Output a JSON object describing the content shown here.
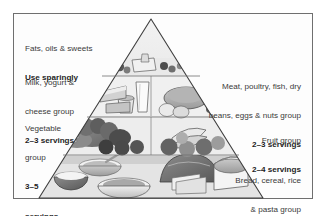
{
  "figure": {
    "kind": "food-guide-pyramid",
    "frame_border_color": "#6f6f6f",
    "background_color": "#ffffff",
    "text_color": "#3a3a3a",
    "emphasis_text_color": "#1d1d1d"
  },
  "labels": {
    "fats": {
      "line1": "Fats, oils & sweets",
      "line2": "Use sparingly"
    },
    "milk": {
      "line1": "Milk, yogurt &",
      "line2": "cheese group",
      "line3": "2–3 servings"
    },
    "vegetable": {
      "line1": "Vegetable",
      "line2": "group",
      "line3": "3–5",
      "line4": "servings"
    },
    "meat": {
      "line1": "Meat, poultry, fish, dry",
      "line2": "beans, eggs & nuts group",
      "line3": "2–3 servings"
    },
    "fruit": {
      "line1": "Fruit group",
      "line2": "2–4 servings"
    },
    "bread": {
      "line1": "Bread, cereal, rice",
      "line2": "& pasta group",
      "line3": "6–11 servings"
    }
  },
  "pyramid": {
    "tiers": [
      {
        "name": "fats-oils-sweets-tier",
        "foods": [
          "butter",
          "candies",
          "oil",
          "sweets"
        ]
      },
      {
        "name": "milk-meat-tier",
        "foods": [
          "milk glass",
          "cheese wedge",
          "yogurt cup",
          "roast meat",
          "eggs",
          "beans",
          "nuts"
        ]
      },
      {
        "name": "vegetable-fruit-tier",
        "foods": [
          "broccoli",
          "carrots",
          "tomatoes",
          "eggplant",
          "lettuce",
          "bananas",
          "apples",
          "oranges",
          "grapes"
        ]
      },
      {
        "name": "grains-tier",
        "foods": [
          "rice bowl",
          "cereal bowl",
          "pasta bowl",
          "bread loaf",
          "sliced bread"
        ]
      }
    ]
  }
}
